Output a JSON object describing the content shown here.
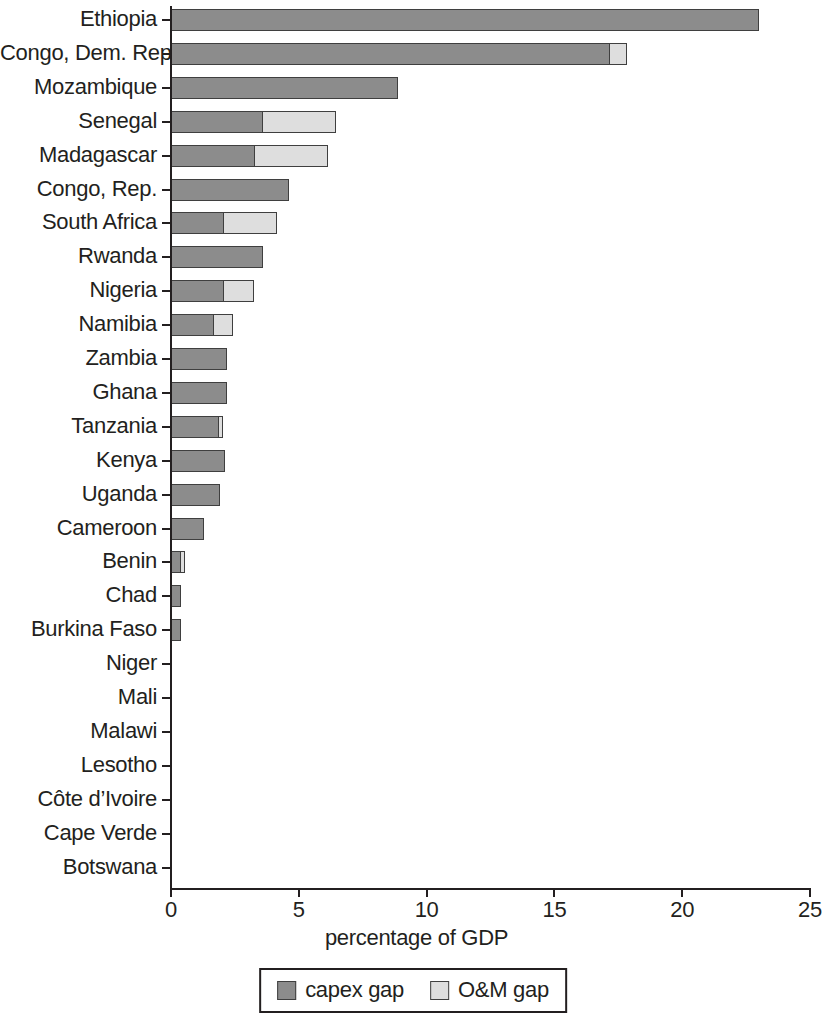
{
  "chart_data": {
    "type": "bar",
    "orientation": "horizontal",
    "stacked": true,
    "title": "",
    "xlabel": "percentage of GDP",
    "ylabel": "",
    "xlim": [
      0,
      25
    ],
    "xticks": [
      0,
      5,
      10,
      15,
      20,
      25
    ],
    "xtick_labels": [
      "0",
      "5",
      "10",
      "15",
      "20",
      "25"
    ],
    "grid": false,
    "legend_position": "bottom",
    "colors": {
      "capex_gap": "#8c8c8c",
      "om_gap": "#dedede",
      "border": "#3f3f3f",
      "axis": "#231f20"
    },
    "categories": [
      "Ethiopia",
      "Congo, Dem. Rep.",
      "Mozambique",
      "Senegal",
      "Madagascar",
      "Congo, Rep.",
      "South Africa",
      "Rwanda",
      "Nigeria",
      "Namibia",
      "Zambia",
      "Ghana",
      "Tanzania",
      "Kenya",
      "Uganda",
      "Cameroon",
      "Benin",
      "Chad",
      "Burkina Faso",
      "Niger",
      "Mali",
      "Malawi",
      "Lesotho",
      "Côte d’Ivoire",
      "Cape Verde",
      "Botswana"
    ],
    "series": [
      {
        "name": "capex gap",
        "values": [
          23.0,
          17.2,
          8.9,
          3.6,
          3.3,
          4.6,
          2.1,
          3.6,
          2.1,
          1.7,
          2.2,
          2.2,
          1.9,
          2.1,
          1.9,
          1.3,
          0.4,
          0.4,
          0.4,
          0.0,
          0.0,
          0.0,
          0.0,
          0.0,
          0.0,
          0.0
        ]
      },
      {
        "name": "O&M gap",
        "values": [
          0.0,
          0.7,
          0.0,
          2.9,
          2.9,
          0.0,
          2.1,
          0.0,
          1.2,
          0.8,
          0.0,
          0.0,
          0.2,
          0.0,
          0.0,
          0.0,
          0.2,
          0.0,
          0.0,
          0.0,
          0.0,
          0.0,
          0.0,
          0.0,
          0.0,
          0.0
        ]
      }
    ],
    "totals": [
      23.0,
      17.9,
      8.9,
      6.5,
      6.2,
      4.6,
      4.2,
      3.6,
      3.3,
      2.5,
      2.2,
      2.2,
      2.1,
      2.1,
      1.9,
      1.3,
      0.6,
      0.4,
      0.4,
      0.0,
      0.0,
      0.0,
      0.0,
      0.0,
      0.0,
      0.0
    ]
  },
  "legend": {
    "items": [
      {
        "label": "capex gap",
        "swatch": "capex"
      },
      {
        "label": "O&M gap",
        "swatch": "om"
      }
    ]
  }
}
